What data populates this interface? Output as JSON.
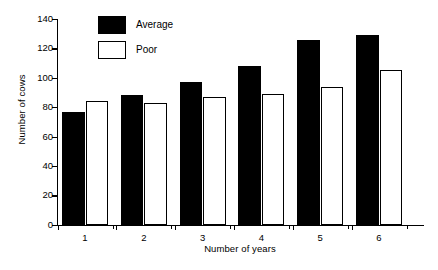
{
  "chart_data": {
    "type": "bar",
    "title": "",
    "subtitle": "",
    "xlabel": "Number of years",
    "ylabel": "Number of cows",
    "categories": [
      "1",
      "2",
      "3",
      "4",
      "5",
      "6"
    ],
    "series": [
      {
        "name": "Average",
        "values": [
          77,
          88,
          97,
          108,
          126,
          129
        ],
        "color": "#000000",
        "style": "filled"
      },
      {
        "name": "Poor",
        "values": [
          84,
          83,
          87,
          89,
          94,
          105
        ],
        "color": "#ffffff",
        "style": "outlined"
      }
    ],
    "ylim": [
      0,
      140
    ],
    "ytick_values": [
      0,
      20,
      40,
      60,
      80,
      100,
      120,
      140
    ],
    "ytick_labels": [
      "0",
      "20",
      "40",
      "60",
      "80",
      "100",
      "120",
      "140"
    ],
    "xtick_labels": [
      "1",
      "2",
      "3",
      "4",
      "5",
      "6"
    ],
    "grid": false,
    "legend_position": "top-left-inside",
    "legend_entries": [
      "Average",
      "Poor"
    ],
    "annotations": []
  }
}
